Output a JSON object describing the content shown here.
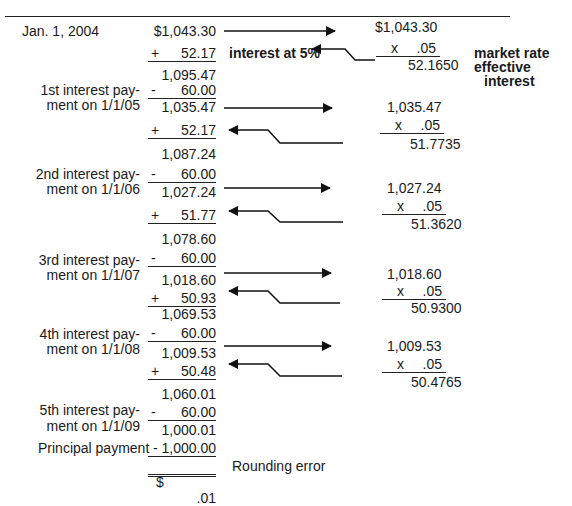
{
  "document": {
    "title_rule": true,
    "left_column": {
      "start_label": "Jan. 1, 2004",
      "start_value": "$1,043.30",
      "rows": [
        {
          "label": [
            "1st interest pay-",
            "ment on 1/1/05"
          ],
          "interest_add": "52.17",
          "subtotal": "1,095.47",
          "payment": "60.00",
          "balance": "1,035.47"
        },
        {
          "label": [
            "2nd interest pay-",
            "ment on 1/1/06"
          ],
          "interest_add": "51.77",
          "subtotal": "1,087.24",
          "payment": "60.00",
          "balance": "1,027.24"
        },
        {
          "label": [
            "3rd interest pay-",
            "ment on 1/1/07"
          ],
          "interest_add": "51.36",
          "subtotal": "1,078.60",
          "payment": "60.00",
          "balance": "1,018.60"
        },
        {
          "label": [
            "4th interest pay-",
            "ment on 1/1/08"
          ],
          "interest_add": "50.93",
          "subtotal": "1,069.53",
          "payment": "60.00",
          "balance": "1,009.53"
        },
        {
          "label": [
            "5th interest pay-",
            "ment on 1/1/09"
          ],
          "interest_add": "50.48",
          "subtotal": "1,060.01",
          "payment": "60.00",
          "balance": "1,000.01"
        }
      ],
      "principal_label": "Principal payment",
      "principal_value": "- 1,000.00",
      "final_dollar": "$",
      "final_value": ".01",
      "final_note": "Rounding error",
      "plus_sign": "+",
      "minus_sign": "-"
    },
    "annotations": {
      "interest_label": "interest at 5%",
      "market_rate": "market rate",
      "effective_interest_1": "effective",
      "effective_interest_2": "interest"
    },
    "right_column": {
      "mult_sign": "x",
      "rate": ".05",
      "calcs": [
        {
          "base": "$1,043.30",
          "result": "52.1650"
        },
        {
          "base": "1,035.47",
          "result": "51.7735"
        },
        {
          "base": "1,027.24",
          "result": "51.3620"
        },
        {
          "base": "1,018.60",
          "result": "50.9300"
        },
        {
          "base": "1,009.53",
          "result": "50.4765"
        }
      ]
    }
  }
}
